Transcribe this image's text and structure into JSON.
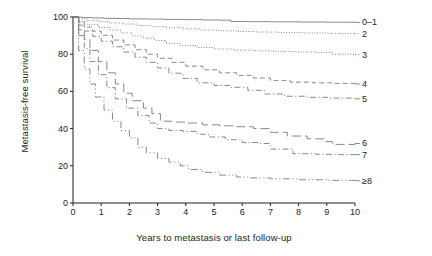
{
  "chart_data": {
    "type": "line",
    "title": "",
    "xlabel": "Years to metastasis or last follow-up",
    "ylabel": "Metastasis-free survival",
    "xlim": [
      0,
      10
    ],
    "ylim": [
      0,
      100
    ],
    "xticks": [
      "0",
      "1",
      "2",
      "3",
      "4",
      "5",
      "6",
      "7",
      "8",
      "9",
      "10"
    ],
    "yticks": [
      "0",
      "20",
      "40",
      "60",
      "80",
      "100"
    ],
    "grid": false,
    "legend_position": "right",
    "line_color": "#7d7d7d",
    "axis_color": "#231f20",
    "series": [
      {
        "name": "0-1",
        "label": "0–1",
        "style": "solid",
        "end_value": 97,
        "x": [
          0,
          0.3,
          0.7,
          1.1,
          1.5,
          2.0,
          2.6,
          3.2,
          4.0,
          4.6,
          5.2,
          5.6,
          6.2,
          7.0,
          8.0,
          9.0,
          10.0
        ],
        "y": [
          100,
          99.7,
          99.5,
          99.3,
          99.2,
          99.0,
          98.9,
          98.7,
          98.6,
          98.4,
          98.3,
          97.6,
          97.5,
          97.4,
          97.3,
          97.2,
          97.1
        ]
      },
      {
        "name": "2",
        "label": "2",
        "style": "dotted",
        "end_value": 91,
        "x": [
          0,
          0.2,
          0.5,
          0.9,
          1.3,
          1.8,
          2.3,
          2.8,
          3.3,
          3.9,
          4.5,
          5.1,
          5.8,
          6.5,
          7.3,
          8.2,
          9.1,
          10.0
        ],
        "y": [
          100,
          99.0,
          98.2,
          97.5,
          96.8,
          96.2,
          95.4,
          94.8,
          94.2,
          93.6,
          93.0,
          92.6,
          92.2,
          91.9,
          91.6,
          91.4,
          91.2,
          91.0
        ]
      },
      {
        "name": "3",
        "label": "3",
        "style": "dotted",
        "end_value": 80,
        "x": [
          0,
          0.2,
          0.5,
          0.9,
          1.3,
          1.7,
          2.1,
          2.5,
          2.9,
          3.3,
          3.8,
          4.4,
          5.0,
          5.7,
          6.4,
          7.1,
          7.9,
          8.6,
          9.2,
          10.0
        ],
        "y": [
          100,
          97.6,
          96.0,
          94.4,
          93.0,
          91.4,
          89.8,
          88.6,
          87.4,
          85.8,
          84.6,
          83.6,
          82.8,
          82.2,
          81.8,
          81.5,
          81.2,
          81.0,
          80.0,
          79.8
        ]
      },
      {
        "name": "4",
        "label": "4",
        "style": "dashed",
        "end_value": 64,
        "x": [
          0,
          0.2,
          0.4,
          0.7,
          1.0,
          1.4,
          1.8,
          2.2,
          2.6,
          3.0,
          3.5,
          4.0,
          4.6,
          5.2,
          5.8,
          6.4,
          7.0,
          7.7,
          8.5,
          9.2,
          10.0
        ],
        "y": [
          100,
          97.0,
          94.6,
          92.4,
          90.2,
          87.6,
          85.0,
          82.4,
          80.0,
          77.8,
          75.6,
          73.6,
          71.6,
          70.0,
          68.6,
          67.2,
          65.8,
          65.0,
          64.6,
          64.3,
          64.0
        ]
      },
      {
        "name": "5",
        "label": "5",
        "style": "dashdot",
        "end_value": 56,
        "x": [
          0,
          0.2,
          0.4,
          0.7,
          1.0,
          1.4,
          1.8,
          2.2,
          2.6,
          3.0,
          3.4,
          3.9,
          4.4,
          5.0,
          5.6,
          6.2,
          6.8,
          7.5,
          8.3,
          9.1,
          10.0
        ],
        "y": [
          100,
          95.6,
          92.4,
          89.6,
          87.0,
          84.0,
          81.2,
          78.4,
          75.6,
          72.6,
          69.8,
          67.0,
          64.6,
          63.2,
          62.2,
          60.6,
          58.6,
          57.4,
          56.8,
          56.4,
          56.0
        ]
      },
      {
        "name": "6",
        "label": "6",
        "style": "longdash",
        "end_value": 32,
        "x": [
          0,
          0.2,
          0.4,
          0.6,
          0.9,
          1.2,
          1.5,
          1.8,
          2.1,
          2.5,
          2.8,
          3.1,
          3.5,
          4.0,
          4.6,
          5.2,
          5.8,
          6.4,
          7.0,
          7.6,
          8.3,
          8.9,
          9.2,
          10.0
        ],
        "y": [
          100,
          93.0,
          88.0,
          82.0,
          76.0,
          70.0,
          64.0,
          59.0,
          55.0,
          51.0,
          48.0,
          44.0,
          43.5,
          43.0,
          42.0,
          41.5,
          41.0,
          40.0,
          38.0,
          36.0,
          34.5,
          33.0,
          31.5,
          32.0
        ]
      },
      {
        "name": "7",
        "label": "7",
        "style": "dashdot",
        "end_value": 26,
        "x": [
          0,
          0.2,
          0.4,
          0.6,
          0.9,
          1.2,
          1.5,
          1.9,
          2.3,
          2.7,
          3.0,
          3.4,
          3.9,
          4.4,
          4.8,
          5.4,
          6.0,
          6.6,
          7.0,
          7.8,
          8.6,
          9.3,
          10.0
        ],
        "y": [
          100,
          90.0,
          83.0,
          76.0,
          69.0,
          62.0,
          56.0,
          51.0,
          47.0,
          43.0,
          40.0,
          39.0,
          38.5,
          37.0,
          35.5,
          34.0,
          32.5,
          32.0,
          29.0,
          26.5,
          26.2,
          26.0,
          26.0
        ]
      },
      {
        "name": "8plus",
        "label": "≥8",
        "style": "dashdotdot",
        "end_value": 12,
        "x": [
          0,
          0.2,
          0.4,
          0.6,
          0.8,
          1.1,
          1.4,
          1.7,
          2.0,
          2.3,
          2.6,
          3.0,
          3.4,
          3.8,
          4.1,
          4.6,
          5.2,
          5.8,
          6.2,
          7.0,
          8.0,
          9.0,
          10.0
        ],
        "y": [
          100,
          82.0,
          72.0,
          64.0,
          57.0,
          50.0,
          44.0,
          39.0,
          35.0,
          30.0,
          27.0,
          24.0,
          22.0,
          20.0,
          18.0,
          16.5,
          15.0,
          14.0,
          13.5,
          13.0,
          12.5,
          12.2,
          12.0
        ]
      }
    ]
  }
}
